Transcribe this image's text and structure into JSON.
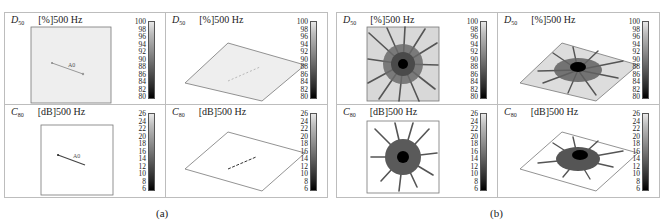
{
  "figure": {
    "groups": [
      {
        "id": "a",
        "caption": "(a)",
        "panels": [
          {
            "metric_symbol": "D",
            "metric_sub": "50",
            "unit_freq": "[%]500 Hz",
            "view": "top",
            "colorbar_ticks": [
              "100",
              "98",
              "96",
              "94",
              "92",
              "90",
              "88",
              "86",
              "84",
              "82",
              "80"
            ],
            "annotation": "A0"
          },
          {
            "metric_symbol": "D",
            "metric_sub": "50",
            "unit_freq": "[%]500 Hz",
            "view": "oblique",
            "colorbar_ticks": [
              "100",
              "98",
              "96",
              "94",
              "92",
              "90",
              "88",
              "86",
              "84",
              "82",
              "80"
            ]
          },
          {
            "metric_symbol": "C",
            "metric_sub": "80",
            "unit_freq": "[dB]500 Hz",
            "view": "top",
            "colorbar_ticks": [
              "26",
              "24",
              "22",
              "20",
              "18",
              "16",
              "14",
              "12",
              "10",
              "8",
              "6"
            ],
            "annotation": "A0"
          },
          {
            "metric_symbol": "C",
            "metric_sub": "80",
            "unit_freq": "[dB]500 Hz",
            "view": "oblique",
            "colorbar_ticks": [
              "26",
              "24",
              "22",
              "20",
              "18",
              "16",
              "14",
              "12",
              "10",
              "8",
              "6"
            ]
          }
        ]
      },
      {
        "id": "b",
        "caption": "(b)",
        "panels": [
          {
            "metric_symbol": "D",
            "metric_sub": "50",
            "unit_freq": "[%]500 Hz",
            "view": "top",
            "colorbar_ticks": [
              "100",
              "98",
              "96",
              "94",
              "92",
              "90",
              "88",
              "86",
              "84",
              "82",
              "80"
            ]
          },
          {
            "metric_symbol": "D",
            "metric_sub": "50",
            "unit_freq": "[%]500 Hz",
            "view": "oblique",
            "colorbar_ticks": [
              "100",
              "98",
              "96",
              "94",
              "92",
              "90",
              "88",
              "86",
              "84",
              "82",
              "80"
            ]
          },
          {
            "metric_symbol": "C",
            "metric_sub": "80",
            "unit_freq": "[dB]500 Hz",
            "view": "top",
            "colorbar_ticks": [
              "26",
              "24",
              "22",
              "20",
              "18",
              "16",
              "14",
              "12",
              "10",
              "8",
              "6"
            ]
          },
          {
            "metric_symbol": "C",
            "metric_sub": "80",
            "unit_freq": "[dB]500 Hz",
            "view": "oblique",
            "colorbar_ticks": [
              "26",
              "24",
              "22",
              "20",
              "18",
              "16",
              "14",
              "12",
              "10",
              "8",
              "6"
            ]
          }
        ]
      }
    ],
    "colors": {
      "border": "#bdbdbd",
      "plane_fill": "#e9e9e9",
      "colormap": "grayscale"
    }
  }
}
